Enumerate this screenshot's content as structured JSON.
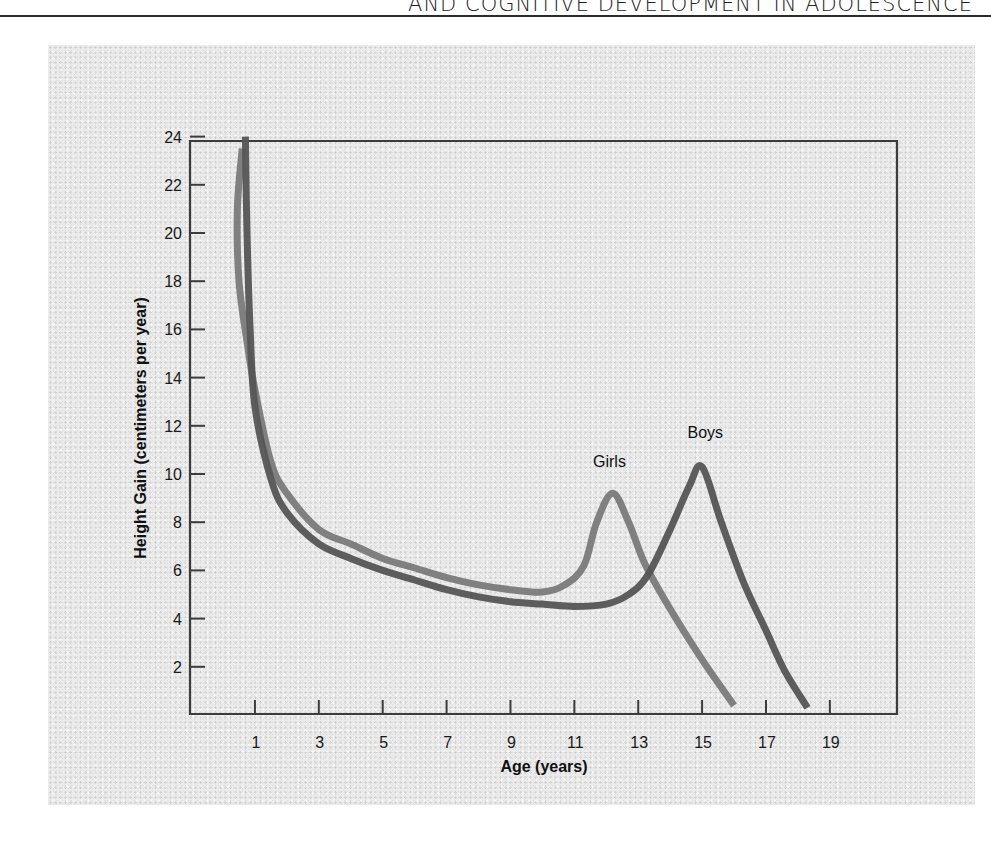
{
  "page": {
    "running_head": "AND COGNITIVE DEVELOPMENT IN ADOLESCENCE"
  },
  "chart_data": {
    "type": "line",
    "title": "",
    "xlabel": "Age (years)",
    "ylabel": "Height Gain (centimeters per year)",
    "xlim": [
      0,
      21
    ],
    "ylim": [
      0,
      24
    ],
    "x_ticks": [
      1,
      3,
      5,
      7,
      9,
      11,
      13,
      15,
      17,
      19
    ],
    "y_ticks": [
      2,
      4,
      6,
      8,
      10,
      12,
      14,
      16,
      18,
      20,
      22,
      24
    ],
    "grid": false,
    "legend": "inline labels at peaks",
    "series": [
      {
        "name": "Girls",
        "color": "#7a7a7a",
        "points": [
          [
            0.6,
            23.5
          ],
          [
            0.45,
            21
          ],
          [
            0.5,
            18
          ],
          [
            0.75,
            15.5
          ],
          [
            1,
            13.5
          ],
          [
            1.5,
            10.5
          ],
          [
            2,
            9.2
          ],
          [
            3,
            7.7
          ],
          [
            4,
            7.1
          ],
          [
            5,
            6.5
          ],
          [
            6,
            6.1
          ],
          [
            7,
            5.7
          ],
          [
            8,
            5.4
          ],
          [
            9,
            5.2
          ],
          [
            10,
            5.1
          ],
          [
            10.7,
            5.4
          ],
          [
            11.3,
            6.2
          ],
          [
            11.7,
            8.0
          ],
          [
            12.2,
            9.2
          ],
          [
            12.7,
            8.0
          ],
          [
            13.2,
            6.3
          ],
          [
            14,
            4.4
          ],
          [
            15,
            2.3
          ],
          [
            16,
            0.4
          ]
        ],
        "peak": {
          "age": 12.2,
          "value": 9.2
        }
      },
      {
        "name": "Boys",
        "color": "#555555",
        "points": [
          [
            0.7,
            24
          ],
          [
            0.75,
            20
          ],
          [
            0.85,
            16
          ],
          [
            1,
            12.8
          ],
          [
            1.5,
            9.8
          ],
          [
            2,
            8.4
          ],
          [
            3,
            7.1
          ],
          [
            4,
            6.5
          ],
          [
            5,
            6.0
          ],
          [
            6,
            5.6
          ],
          [
            7,
            5.2
          ],
          [
            8,
            4.9
          ],
          [
            9,
            4.7
          ],
          [
            10,
            4.6
          ],
          [
            11,
            4.5
          ],
          [
            12,
            4.6
          ],
          [
            12.7,
            5.0
          ],
          [
            13.3,
            5.8
          ],
          [
            14,
            7.7
          ],
          [
            14.6,
            9.5
          ],
          [
            15,
            10.3
          ],
          [
            15.6,
            8.0
          ],
          [
            16.3,
            5.5
          ],
          [
            17,
            3.5
          ],
          [
            17.6,
            1.8
          ],
          [
            18.3,
            0.3
          ]
        ],
        "peak": {
          "age": 15,
          "value": 10.3
        }
      }
    ],
    "annotations": [
      {
        "text": "Girls",
        "x": 12.1,
        "y": 10.3
      },
      {
        "text": "Boys",
        "x": 15.1,
        "y": 11.5
      }
    ]
  }
}
